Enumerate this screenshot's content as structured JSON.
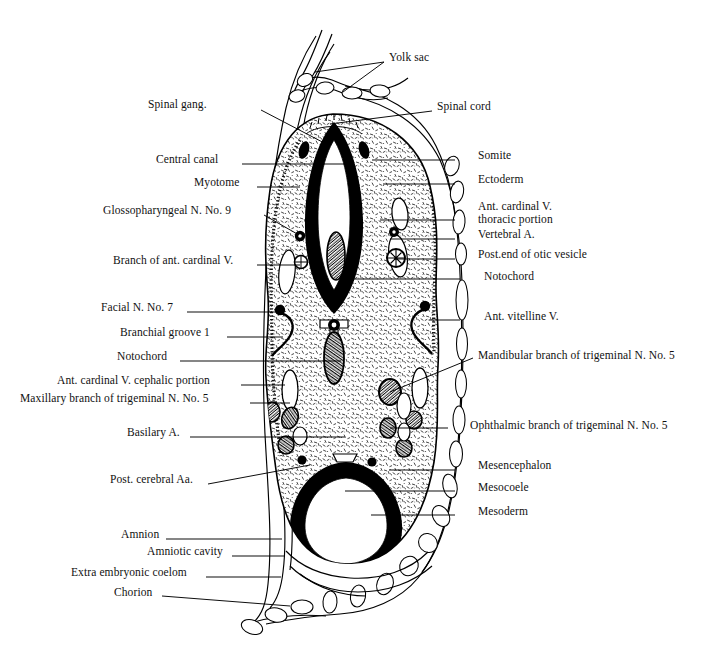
{
  "figure": {
    "type": "anatomical-cross-section-diagram",
    "ink_color": "#000000",
    "background_color": "#ffffff"
  },
  "labels_left": [
    {
      "id": "spinal-gang",
      "text": "Spinal gang.",
      "x": 148,
      "y": 104,
      "anchor_x": 261,
      "anchor_y": 110,
      "target_x": 330,
      "target_y": 146
    },
    {
      "id": "central-canal",
      "text": "Central canal",
      "x": 156,
      "y": 159,
      "anchor_x": 242,
      "anchor_y": 164,
      "target_x": 345,
      "target_y": 164
    },
    {
      "id": "myotome",
      "text": "Myotome",
      "x": 194,
      "y": 182,
      "anchor_x": 257,
      "anchor_y": 187,
      "target_x": 300,
      "target_y": 187
    },
    {
      "id": "glossopharyngeal",
      "text": "Glossopharyngeal N. No. 9",
      "x": 103,
      "y": 210,
      "anchor_x": 264,
      "anchor_y": 215,
      "target_x": 299,
      "target_y": 235
    },
    {
      "id": "branch-ant-card-v",
      "text": "Branch of ant. cardinal V.",
      "x": 113,
      "y": 260,
      "anchor_x": 257,
      "anchor_y": 265,
      "target_x": 300,
      "target_y": 265
    },
    {
      "id": "facial-n-7",
      "text": "Facial N. No. 7",
      "x": 101,
      "y": 307,
      "anchor_x": 187,
      "anchor_y": 312,
      "target_x": 281,
      "target_y": 312
    },
    {
      "id": "branchial-groove-1",
      "text": "Branchial groove 1",
      "x": 120,
      "y": 332,
      "anchor_x": 227,
      "anchor_y": 337,
      "target_x": 283,
      "target_y": 337
    },
    {
      "id": "notochord-left",
      "text": "Notochord",
      "x": 117,
      "y": 356,
      "anchor_x": 180,
      "anchor_y": 361,
      "target_x": 341,
      "target_y": 361
    },
    {
      "id": "ant-card-v-ceph",
      "text": "Ant. cardinal V. cephalic portion",
      "x": 57,
      "y": 380,
      "anchor_x": 241,
      "anchor_y": 385,
      "target_x": 285,
      "target_y": 385
    },
    {
      "id": "maxillary-branch",
      "text": "Maxillary branch of trigeminal N. No. 5",
      "x": 20,
      "y": 398,
      "anchor_x": 250,
      "anchor_y": 403,
      "target_x": 290,
      "target_y": 403
    },
    {
      "id": "basilary-a",
      "text": "Basilary A.",
      "x": 127,
      "y": 432,
      "anchor_x": 190,
      "anchor_y": 437,
      "target_x": 345,
      "target_y": 437
    },
    {
      "id": "post-cerebral-aa",
      "text": "Post. cerebral Aa.",
      "x": 110,
      "y": 479,
      "anchor_x": 208,
      "anchor_y": 484,
      "target_x": 310,
      "target_y": 465
    },
    {
      "id": "amnion",
      "text": "Amnion",
      "x": 121,
      "y": 534,
      "anchor_x": 166,
      "anchor_y": 539,
      "target_x": 282,
      "target_y": 539
    },
    {
      "id": "amniotic-cavity",
      "text": "Amniotic cavity",
      "x": 147,
      "y": 551,
      "anchor_x": 232,
      "anchor_y": 556,
      "target_x": 285,
      "target_y": 556
    },
    {
      "id": "extra-emb-coelom",
      "text": "Extra embryonic coelom",
      "x": 71,
      "y": 572,
      "anchor_x": 206,
      "anchor_y": 577,
      "target_x": 281,
      "target_y": 577
    },
    {
      "id": "chorion",
      "text": "Chorion",
      "x": 114,
      "y": 592,
      "anchor_x": 162,
      "anchor_y": 596,
      "target_x": 290,
      "target_y": 606
    }
  ],
  "labels_right": [
    {
      "id": "yolk-sac",
      "text": "Yolk sac",
      "x": 389,
      "y": 57,
      "anchor_x": 384,
      "anchor_y": 62,
      "target_x": 315,
      "target_y": 72,
      "target2_x": 343,
      "target2_y": 92
    },
    {
      "id": "spinal-cord",
      "text": "Spinal cord",
      "x": 437,
      "y": 106,
      "anchor_x": 432,
      "anchor_y": 111,
      "target_x": 330,
      "target_y": 124
    },
    {
      "id": "somite",
      "text": "Somite",
      "x": 478,
      "y": 155,
      "anchor_x": 455,
      "anchor_y": 160,
      "target_x": 372,
      "target_y": 160
    },
    {
      "id": "ectoderm",
      "text": "Ectoderm",
      "x": 478,
      "y": 179,
      "anchor_x": 455,
      "anchor_y": 184,
      "target_x": 383,
      "target_y": 184
    },
    {
      "id": "ant-card-v-thor",
      "text": "Ant. cardinal V.\nthoracic portion",
      "x": 478,
      "y": 206,
      "anchor_x": 455,
      "anchor_y": 220,
      "target_x": 380,
      "target_y": 220
    },
    {
      "id": "vertebral-a",
      "text": "Vertebral A.",
      "x": 478,
      "y": 234,
      "anchor_x": 455,
      "anchor_y": 239,
      "target_x": 390,
      "target_y": 239
    },
    {
      "id": "post-end-otic",
      "text": "Post.end of otic vesicle",
      "x": 478,
      "y": 254,
      "anchor_x": 455,
      "anchor_y": 259,
      "target_x": 394,
      "target_y": 259
    },
    {
      "id": "notochord-right",
      "text": "Notochord",
      "x": 484,
      "y": 276,
      "anchor_x": 460,
      "anchor_y": 279,
      "target_x": 348,
      "target_y": 279
    },
    {
      "id": "ant-vitelline-v",
      "text": "Ant. vitelline V.",
      "x": 484,
      "y": 316,
      "anchor_x": 460,
      "anchor_y": 320,
      "target_x": 429,
      "target_y": 320
    },
    {
      "id": "mandibular-branch",
      "text": "Mandibular branch of trigeminal N. No. 5",
      "x": 478,
      "y": 355,
      "anchor_x": 473,
      "anchor_y": 358,
      "target_x": 390,
      "target_y": 392
    },
    {
      "id": "ophthalmic-branch",
      "text": "Ophthalmic branch of trigeminal N. No. 5",
      "x": 470,
      "y": 425,
      "anchor_x": 448,
      "anchor_y": 428,
      "target_x": 390,
      "target_y": 428
    },
    {
      "id": "mesencephalon",
      "text": "Mesencephalon",
      "x": 478,
      "y": 465,
      "anchor_x": 455,
      "anchor_y": 470,
      "target_x": 389,
      "target_y": 470
    },
    {
      "id": "mesocoele",
      "text": "Mesocoele",
      "x": 478,
      "y": 487,
      "anchor_x": 455,
      "anchor_y": 491,
      "target_x": 345,
      "target_y": 491
    },
    {
      "id": "mesoderm",
      "text": "Mesoderm",
      "x": 478,
      "y": 511,
      "anchor_x": 455,
      "anchor_y": 515,
      "target_x": 371,
      "target_y": 515
    }
  ]
}
